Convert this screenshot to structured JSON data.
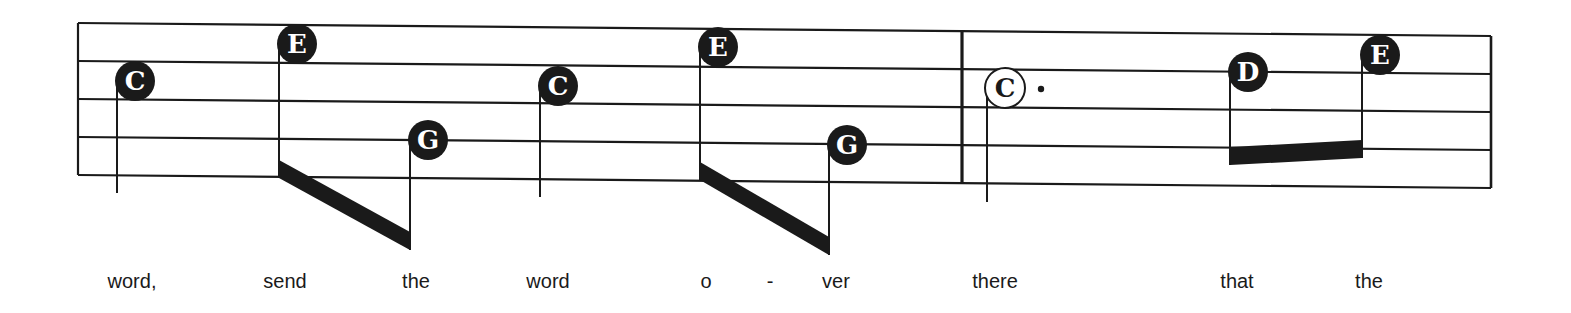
{
  "colors": {
    "ink": "#1a1a1a",
    "paper": "#ffffff"
  },
  "staff": {
    "left_x": 78,
    "right_x": 1491,
    "left_top_y": 23,
    "right_top_y": 36,
    "line_gap": 38,
    "line_count": 5,
    "barline_x": 962
  },
  "notes": [
    {
      "letter": "C",
      "x": 135,
      "y": 81,
      "filled": true,
      "stem_bottom": 193
    },
    {
      "letter": "E",
      "x": 297,
      "y": 44,
      "filled": true,
      "stem_bottom": 178,
      "beam_group": 0
    },
    {
      "letter": "G",
      "x": 428,
      "y": 140,
      "filled": true,
      "stem_bottom": 250,
      "beam_group": 0
    },
    {
      "letter": "C",
      "x": 558,
      "y": 86,
      "filled": true,
      "stem_bottom": 197
    },
    {
      "letter": "E",
      "x": 718,
      "y": 47,
      "filled": true,
      "stem_bottom": 180,
      "beam_group": 1
    },
    {
      "letter": "G",
      "x": 847,
      "y": 145,
      "filled": true,
      "stem_bottom": 255,
      "beam_group": 1
    },
    {
      "letter": "C",
      "x": 1005,
      "y": 88,
      "filled": false,
      "stem_bottom": 202,
      "dotted": true
    },
    {
      "letter": "D",
      "x": 1248,
      "y": 72,
      "filled": true,
      "stem_bottom": 165,
      "beam_group": 2
    },
    {
      "letter": "E",
      "x": 1380,
      "y": 55,
      "filled": true,
      "stem_bottom": 158,
      "beam_group": 2
    }
  ],
  "lyrics": [
    {
      "text": "word,",
      "x": 132
    },
    {
      "text": "send",
      "x": 285
    },
    {
      "text": "the",
      "x": 416
    },
    {
      "text": "word",
      "x": 548
    },
    {
      "text": "o",
      "x": 706
    },
    {
      "text": "-",
      "x": 770
    },
    {
      "text": "ver",
      "x": 836
    },
    {
      "text": "there",
      "x": 995
    },
    {
      "text": "that",
      "x": 1237
    },
    {
      "text": "the",
      "x": 1369
    }
  ]
}
